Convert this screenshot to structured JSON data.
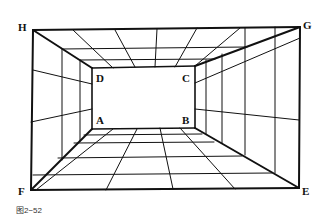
{
  "figure": {
    "caption": "图2−52",
    "labels": {
      "H": "H",
      "G": "G",
      "F": "F",
      "E": "E",
      "D": "D",
      "C": "C",
      "A": "A",
      "B": "B"
    },
    "points": {
      "H": [
        33,
        30
      ],
      "G": [
        300,
        27
      ],
      "F": [
        31,
        190
      ],
      "E": [
        299,
        188
      ],
      "D": [
        92,
        68
      ],
      "C": [
        195,
        66
      ],
      "A": [
        92,
        129
      ],
      "B": [
        195,
        128
      ]
    },
    "stroke_color": "#111111"
  }
}
